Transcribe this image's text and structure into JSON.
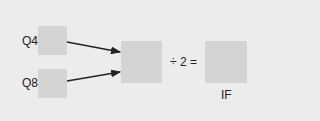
{
  "diagram": {
    "inputs": [
      {
        "label": "Q4"
      },
      {
        "label": "Q8"
      }
    ],
    "operator": "÷ 2 =",
    "output": {
      "label": "IF"
    },
    "colors": {
      "background": "#ececec",
      "box": "#d4d4d4",
      "arrow": "#222222",
      "text": "#222222"
    }
  }
}
